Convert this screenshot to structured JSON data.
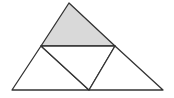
{
  "diagram": {
    "colors": {
      "background": "#ffffff",
      "stroke": "#333333",
      "shaded_fill": "#d9d9d9",
      "unshaded_fill": "#ffffff"
    },
    "vertices": {
      "apex": [
        69,
        3
      ],
      "bottom_left": [
        12,
        90
      ],
      "bottom_right": [
        163,
        90
      ],
      "left_mid": [
        41,
        46
      ],
      "right_mid": [
        115,
        46
      ],
      "bottom_mid": [
        89,
        90
      ]
    },
    "regions": [
      {
        "name": "top-triangle",
        "shaded": true
      },
      {
        "name": "bottom-left-triangle",
        "shaded": false
      },
      {
        "name": "center-triangle",
        "shaded": false
      },
      {
        "name": "bottom-right-triangle",
        "shaded": false
      }
    ]
  }
}
